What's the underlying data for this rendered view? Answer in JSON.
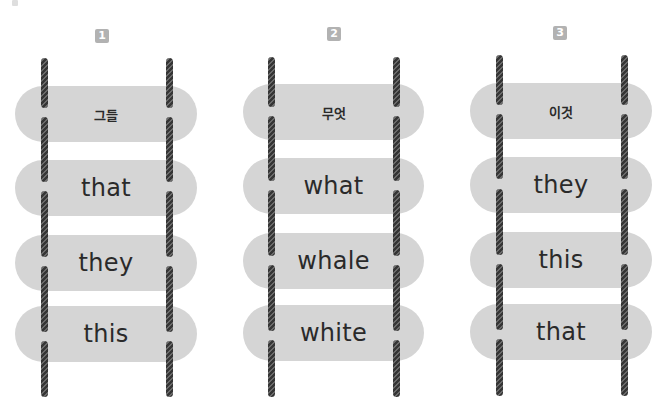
{
  "exercise": {
    "ladders": [
      {
        "number": "1",
        "prompt": "그들",
        "options": [
          "that",
          "they",
          "this"
        ]
      },
      {
        "number": "2",
        "prompt": "무엇",
        "options": [
          "what",
          "whale",
          "white"
        ]
      },
      {
        "number": "3",
        "prompt": "이것",
        "options": [
          "they",
          "this",
          "that"
        ]
      }
    ]
  },
  "colors": {
    "pill": "#d5d5d5",
    "badge": "#b2b2b2",
    "rail": "#353535",
    "text": "#2a2a2a"
  }
}
